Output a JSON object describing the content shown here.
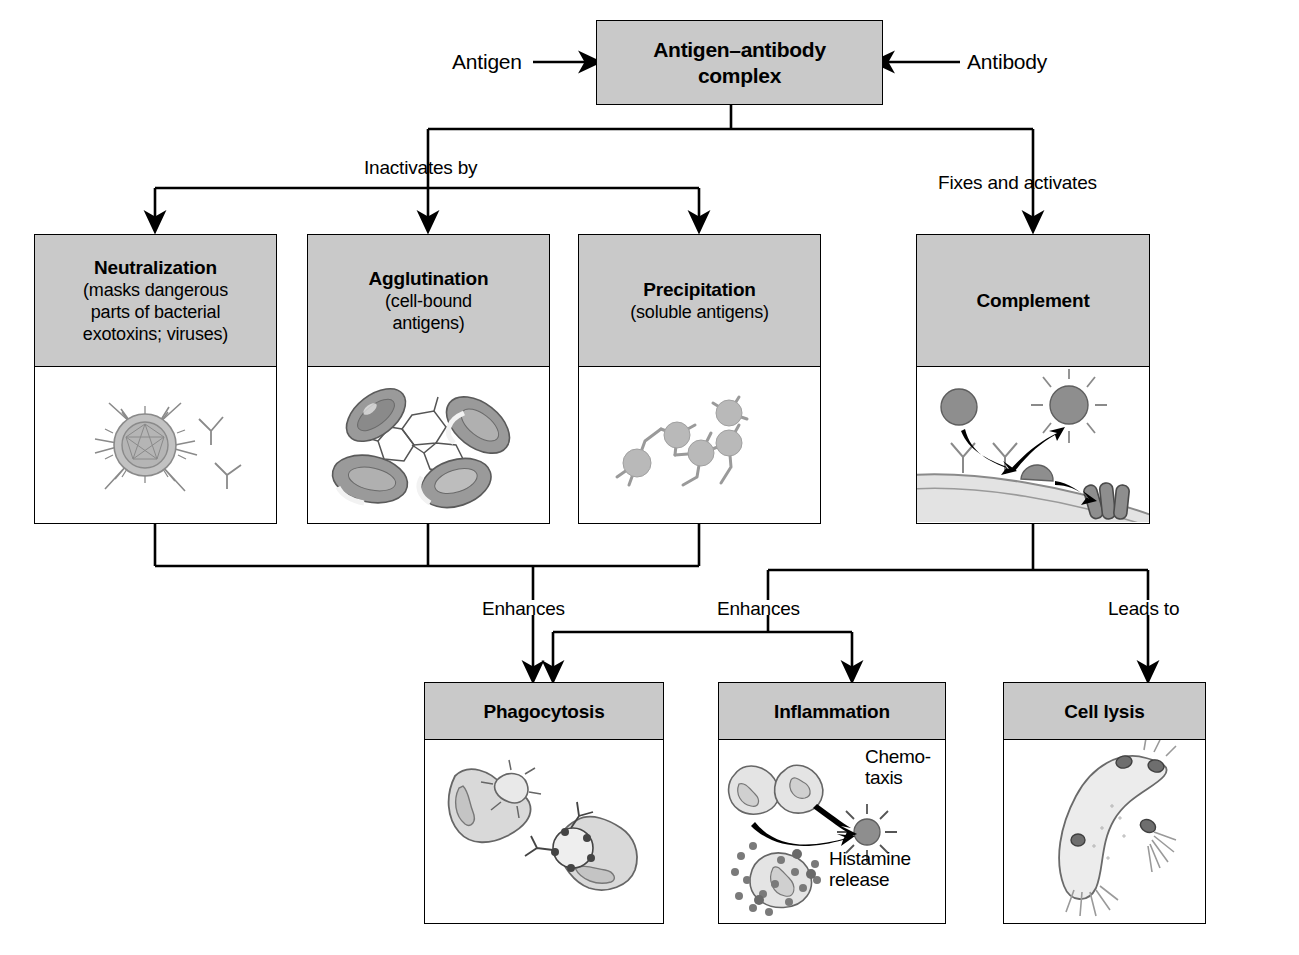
{
  "figure": {
    "type": "flowchart",
    "title_box": {
      "line1": "Antigen–antibody",
      "line2": "complex"
    },
    "inputs": [
      {
        "name": "antigen",
        "label": "Antigen",
        "side": "left"
      },
      {
        "name": "antibody",
        "label": "Antibody",
        "side": "right"
      }
    ],
    "connector_labels": {
      "inactivates": "Inactivates by",
      "fixes": "Fixes and activates",
      "enhances_left": "Enhances",
      "enhances_right": "Enhances",
      "leads_to": "Leads to"
    },
    "mechanisms": [
      {
        "name": "neutralization",
        "title": "Neutralization",
        "subtitle": "(masks dangerous parts of bacterial exotoxins; viruses)",
        "subtitle_lines": [
          "(masks dangerous",
          "parts of bacterial",
          "exotoxins; viruses)"
        ],
        "illustration": "virus-coated-by-antibodies"
      },
      {
        "name": "agglutination",
        "title": "Agglutination",
        "subtitle": "(cell-bound antigens)",
        "subtitle_lines": [
          "(cell-bound",
          "antigens)"
        ],
        "illustration": "clumped-red-blood-cells"
      },
      {
        "name": "precipitation",
        "title": "Precipitation",
        "subtitle": "(soluble antigens)",
        "subtitle_lines": [
          "(soluble antigens)"
        ],
        "illustration": "soluble-antigen-antibody-lattice"
      },
      {
        "name": "complement",
        "title": "Complement",
        "subtitle": "",
        "subtitle_lines": [],
        "illustration": "complement-cascade-on-membrane"
      }
    ],
    "outcomes": [
      {
        "name": "phagocytosis",
        "title": "Phagocytosis",
        "illustration": "macrophage-engulfing-microbes"
      },
      {
        "name": "inflammation",
        "title": "Inflammation",
        "illustration": "chemotaxis-and-histamine-release",
        "art_labels": {
          "chemotaxis_lines": [
            "Chemo-",
            "taxis"
          ],
          "histamine_lines": [
            "Histamine",
            "release"
          ]
        }
      },
      {
        "name": "cell-lysis",
        "title": "Cell lysis",
        "illustration": "lysing-bacterium"
      }
    ],
    "colors": {
      "box_header_fill": "#c9c9c9",
      "box_body_fill": "#ffffff",
      "stroke": "#000000",
      "cell_fill": "#8e8e8e",
      "light_fill": "#dcdcdc",
      "mid_fill": "#b4b4b4"
    }
  }
}
